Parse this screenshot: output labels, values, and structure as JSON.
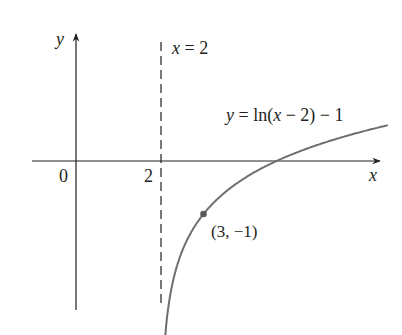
{
  "chart_data": {
    "type": "line",
    "title": "",
    "xlabel": "x",
    "ylabel": "y",
    "function": "y = ln(x - 2) - 1",
    "curve_label": "y = ln(x − 2) − 1",
    "asymptote": {
      "x": 2,
      "label": "x = 2",
      "style": "dashed"
    },
    "tick_labels": {
      "origin": "0",
      "x_tick": "2"
    },
    "points": [
      {
        "x": 3,
        "y": -1,
        "label": "(3, −1)"
      }
    ],
    "x_intercept": 4.718,
    "x_range": [
      -0.9,
      7.6
    ],
    "y_range": [
      -2.7,
      1.5
    ],
    "grid": false,
    "legend": "none"
  },
  "labels": {
    "y_axis": "y",
    "x_axis": "x",
    "origin": "0",
    "tick_2": "2",
    "asymptote": "x = 2",
    "curve_y": "y",
    "curve_eq": " = ln(",
    "curve_x": "x",
    "curve_rest": " − 2) − 1",
    "point": "(3, −1)"
  },
  "colors": {
    "axis": "#231f20",
    "curve": "#6d6e71",
    "point": "#58595b"
  }
}
